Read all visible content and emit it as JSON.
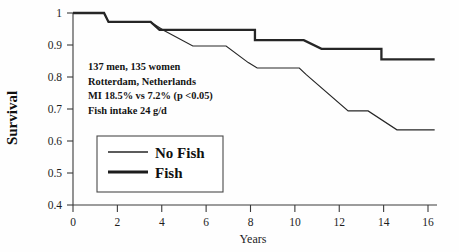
{
  "chart_data": {
    "type": "line",
    "title": "",
    "xlabel": "Years",
    "ylabel": "Survival",
    "xlim": [
      0,
      16.4
    ],
    "ylim": [
      0.4,
      1.02
    ],
    "xticks": [
      0,
      2,
      4,
      6,
      8,
      10,
      12,
      14,
      16
    ],
    "xtick_labels": [
      "0",
      "2",
      "4",
      "6",
      "8",
      "10",
      "12",
      "14",
      "16"
    ],
    "yticks": [
      0.4,
      0.5,
      0.6,
      0.7,
      0.8,
      0.9,
      1
    ],
    "ytick_labels": [
      "0.4",
      "0.5",
      "0.6",
      "0.7",
      "0.8",
      "0.9",
      "1"
    ],
    "grid": false,
    "legend_position": "lower-left",
    "line_color": "#262626",
    "series": [
      {
        "name": "Fish",
        "style": "thick",
        "x": [
          0,
          1.4,
          1.6,
          3.5,
          3.9,
          8.2,
          8.2,
          10.4,
          11.2,
          13.9,
          13.9,
          16.3
        ],
        "y": [
          1.0,
          1.0,
          0.972,
          0.972,
          0.947,
          0.947,
          0.915,
          0.915,
          0.888,
          0.888,
          0.855,
          0.855
        ]
      },
      {
        "name": "No Fish",
        "style": "thin",
        "x": [
          0,
          1.4,
          1.6,
          3.5,
          4.1,
          5.4,
          6.9,
          7.9,
          8.3,
          10.2,
          10.5,
          12.4,
          13.3,
          14.6,
          16.3
        ],
        "y": [
          1.0,
          1.0,
          0.972,
          0.972,
          0.945,
          0.897,
          0.897,
          0.845,
          0.828,
          0.828,
          0.808,
          0.694,
          0.694,
          0.635,
          0.635
        ]
      }
    ],
    "annotations": [
      "137 men, 135 women",
      "Rotterdam, Netherlands",
      "MI 18.5%   vs  7.2%   (p <0.05)",
      "Fish intake 24 g/d"
    ]
  },
  "legend": {
    "entries": [
      {
        "label": "No Fish"
      },
      {
        "label": "Fish"
      }
    ]
  }
}
